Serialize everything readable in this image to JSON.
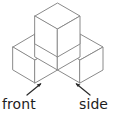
{
  "figure": {
    "name": "isometric-cube-stack",
    "cube_count": 4,
    "bottom_layer_cubes": 3,
    "top_layer_cubes": 1,
    "stroke_color": "#8a8a8a",
    "face_color": "#ffffff",
    "label_color": "#1d1d1d",
    "leader_color": "#2b2b2b"
  },
  "labels": {
    "front": "front",
    "side": "side"
  },
  "geometry": {
    "top_cube": {
      "apex": [
        57.5,
        3
      ],
      "top_left": [
        35,
        16
      ],
      "top_right": [
        80,
        16
      ],
      "center": [
        57.5,
        29
      ],
      "bottom_left": [
        35,
        44
      ],
      "bottom_center": [
        57.5,
        57
      ],
      "bottom_right": [
        80,
        44
      ]
    },
    "base_outline": [
      [
        13,
        47
      ],
      [
        35,
        34
      ],
      [
        57.5,
        47
      ],
      [
        80,
        34
      ],
      [
        103,
        47
      ],
      [
        103,
        70
      ],
      [
        80,
        83
      ],
      [
        57.5,
        70
      ],
      [
        35,
        83
      ],
      [
        13,
        70
      ]
    ],
    "bounds": {
      "left": 13,
      "right": 103,
      "top": 3,
      "bottom": 83
    }
  },
  "leaders": {
    "front": {
      "from": [
        27,
        95
      ],
      "to": [
        40,
        84
      ]
    },
    "side": {
      "from": [
        90,
        95
      ],
      "to": [
        77,
        84
      ]
    }
  }
}
